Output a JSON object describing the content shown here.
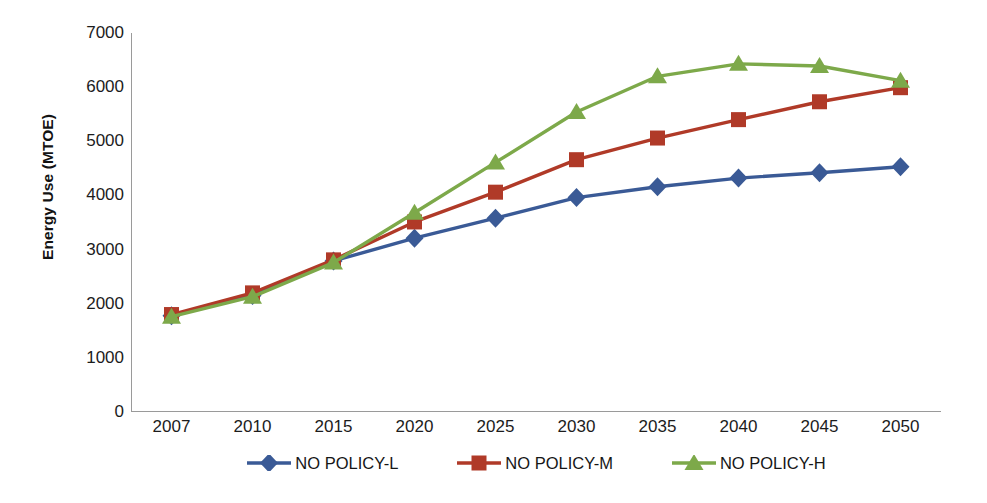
{
  "chart_data": {
    "type": "line",
    "title": "",
    "xlabel": "",
    "ylabel": "Energy Use (MTOE)",
    "categories": [
      "2007",
      "2010",
      "2015",
      "2020",
      "2025",
      "2030",
      "2035",
      "2040",
      "2045",
      "2050"
    ],
    "x_values": [
      2007,
      2010,
      2015,
      2020,
      2025,
      2030,
      2035,
      2040,
      2045,
      2050
    ],
    "ylim": [
      0,
      7000
    ],
    "y_ticks": [
      7000,
      6000,
      5000,
      4000,
      3000,
      2000,
      1000,
      0
    ],
    "grid": false,
    "legend_position": "bottom",
    "series": [
      {
        "name": "NO POLICY-L",
        "color": "#3A5A96",
        "marker": "diamond",
        "values": [
          1780,
          2150,
          2790,
          3210,
          3580,
          3960,
          4160,
          4320,
          4420,
          4530
        ]
      },
      {
        "name": "NO POLICY-M",
        "color": "#B03A28",
        "marker": "square",
        "values": [
          1800,
          2200,
          2810,
          3510,
          4060,
          4660,
          5060,
          5400,
          5730,
          5990
        ]
      },
      {
        "name": "NO POLICY-H",
        "color": "#7DA94A",
        "marker": "triangle",
        "values": [
          1760,
          2130,
          2760,
          3680,
          4610,
          5540,
          6200,
          6430,
          6390,
          6120
        ]
      }
    ]
  },
  "axis": {
    "y_title": "Energy Use (MTOE)",
    "y_tick_labels": [
      "7000",
      "6000",
      "5000",
      "4000",
      "3000",
      "2000",
      "1000",
      "0"
    ],
    "x_tick_labels": [
      "2007",
      "2010",
      "2015",
      "2020",
      "2025",
      "2030",
      "2035",
      "2040",
      "2045",
      "2050"
    ]
  },
  "legend": {
    "items": [
      {
        "label": "NO POLICY-L",
        "color": "#3A5A96",
        "marker": "diamond"
      },
      {
        "label": "NO POLICY-M",
        "color": "#B03A28",
        "marker": "square"
      },
      {
        "label": "NO POLICY-H",
        "color": "#7DA94A",
        "marker": "triangle"
      }
    ]
  },
  "caption": {
    "text": ""
  },
  "colors": {
    "series_low": "#3A5A96",
    "series_mid": "#B03A28",
    "series_high": "#7DA94A",
    "axis": "#9a9a9a",
    "text": "#1a1a1a",
    "background": "#ffffff"
  }
}
